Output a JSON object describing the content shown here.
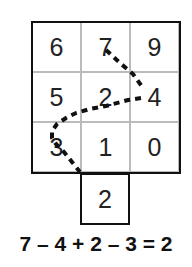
{
  "grid": {
    "rows": [
      [
        "6",
        "7",
        "9"
      ],
      [
        "5",
        "2",
        "4"
      ],
      [
        "3",
        "1",
        "0"
      ]
    ],
    "extra_cell": "2"
  },
  "path": {
    "description": "dotted path 7 -> 4 -> 2 -> 3 -> 2 (bottom)",
    "color": "#111111"
  },
  "equation": "7 – 4 + 2 – 3 = 2"
}
